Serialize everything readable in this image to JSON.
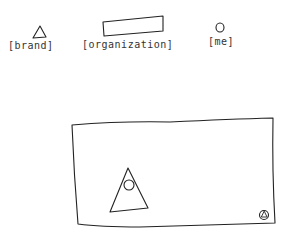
{
  "header": {
    "brand": {
      "label": "[brand]",
      "icon": "triangle-icon"
    },
    "organization": {
      "label": "[organization]",
      "icon": "rectangle-placeholder"
    },
    "me": {
      "label": "[me]",
      "icon": "circle-icon"
    }
  },
  "main_panel": {
    "graphic": "triangle-with-circle",
    "corner_icon": "circle-triangle-icon"
  },
  "colors": {
    "stroke": "#222222",
    "background": "#ffffff"
  }
}
